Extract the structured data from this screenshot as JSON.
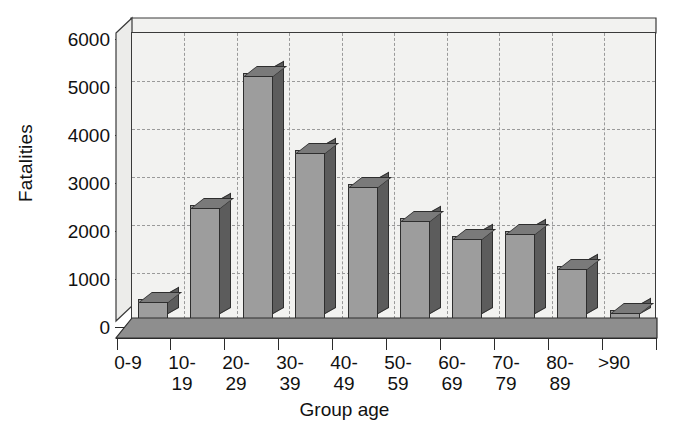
{
  "chart_data": {
    "type": "bar",
    "title": "",
    "xlabel": "Group age",
    "ylabel": "Fatalities",
    "categories": [
      "0-9",
      "10-19",
      "20-29",
      "30-39",
      "40-49",
      "50-59",
      "60-69",
      "70-79",
      "80-89",
      ">90"
    ],
    "category_lines": [
      [
        "0-9",
        ""
      ],
      [
        "10-",
        "19"
      ],
      [
        "20-",
        "29"
      ],
      [
        "30-",
        "39"
      ],
      [
        "40-",
        "49"
      ],
      [
        "50-",
        "59"
      ],
      [
        "60-",
        "69"
      ],
      [
        "70-",
        "79"
      ],
      [
        "80-",
        "89"
      ],
      [
        ">90",
        ""
      ]
    ],
    "values": [
      430,
      2400,
      5150,
      3550,
      2830,
      2120,
      1760,
      1850,
      1120,
      210
    ],
    "ylim": [
      0,
      6000
    ],
    "ytick_labels": [
      "0",
      "1000",
      "2000",
      "3000",
      "4000",
      "5000",
      "6000"
    ],
    "yticks": [
      0,
      1000,
      2000,
      3000,
      4000,
      5000,
      6000
    ],
    "grid": true,
    "legend": "none",
    "style": "3d-bar",
    "colors": {
      "bar_front": "#9d9d9d",
      "bar_side": "#5c5c5c",
      "bar_top": "#7a7a7a",
      "plot_background": "#f2f2f0",
      "gridline": "#9a9a9a",
      "axis": "#2b2b2b",
      "text": "#111111",
      "floor": "#8e8e8e"
    }
  }
}
